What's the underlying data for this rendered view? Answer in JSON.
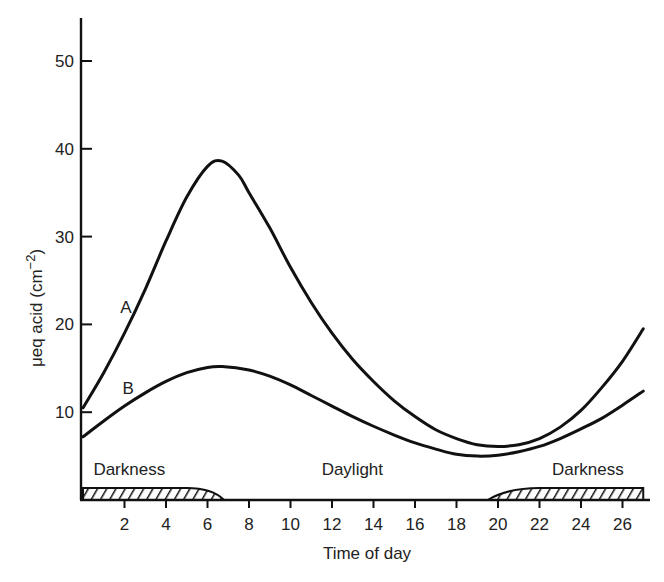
{
  "chart_data": {
    "type": "line",
    "title": "",
    "xlabel": "Time of day",
    "ylabel": "μeq acid (cm⁻²)",
    "ylabel_parts": {
      "main": "μeq acid (cm",
      "sup": "−2",
      "close": ")"
    },
    "xlim": [
      0,
      27
    ],
    "ylim": [
      0,
      55
    ],
    "x_ticks": [
      2,
      4,
      6,
      8,
      10,
      12,
      14,
      16,
      18,
      20,
      22,
      24,
      26
    ],
    "y_ticks": [
      10,
      20,
      30,
      40,
      50
    ],
    "grid": false,
    "series": [
      {
        "name": "A",
        "x": [
          0,
          1,
          2,
          3,
          4,
          5,
          6,
          6.7,
          7.5,
          8,
          9,
          10,
          11,
          12,
          13,
          14,
          15,
          16,
          17,
          18,
          19,
          20,
          21,
          22,
          23,
          24,
          25,
          26,
          27
        ],
        "y": [
          10.5,
          14.5,
          19,
          24,
          29.5,
          34.5,
          38,
          38.6,
          37,
          35,
          31,
          26.5,
          22.5,
          19,
          16,
          13.5,
          11.3,
          9.5,
          8,
          7,
          6.3,
          6.1,
          6.3,
          7,
          8.3,
          10.2,
          12.8,
          15.8,
          19.5
        ]
      },
      {
        "name": "B",
        "x": [
          0,
          1,
          2,
          3,
          4,
          5,
          6,
          6.7,
          8,
          9,
          10,
          11,
          12,
          13,
          14,
          15,
          16,
          17,
          18,
          19,
          20,
          21,
          22,
          23,
          24,
          25,
          26,
          27
        ],
        "y": [
          7.2,
          9,
          10.7,
          12.2,
          13.5,
          14.5,
          15.1,
          15.2,
          14.8,
          14.1,
          13.1,
          11.9,
          10.7,
          9.5,
          8.4,
          7.4,
          6.5,
          5.8,
          5.2,
          5,
          5.1,
          5.5,
          6.1,
          7,
          8.1,
          9.3,
          10.8,
          12.4
        ]
      }
    ],
    "annotations": [
      {
        "text": "A",
        "x": 1.8,
        "y": 22
      },
      {
        "text": "B",
        "x": 1.9,
        "y": 12.7
      },
      {
        "text": "Darkness",
        "x": 0.5,
        "y": 3.5
      },
      {
        "text": "Daylight",
        "x": 11.5,
        "y": 3.5
      },
      {
        "text": "Darkness",
        "x": 22.6,
        "y": 3.5
      }
    ],
    "darkness_bands": [
      {
        "start": 0,
        "end": 6.8,
        "label": "Darkness"
      },
      {
        "start": 19.5,
        "end": 27,
        "label": "Darkness"
      }
    ]
  }
}
